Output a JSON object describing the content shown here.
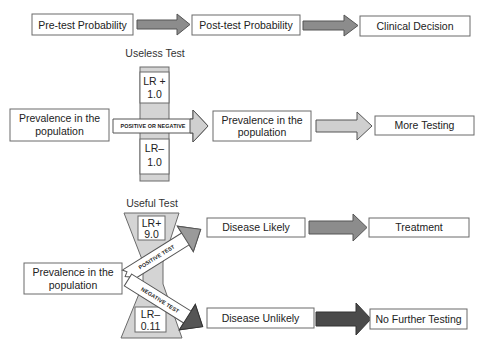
{
  "top_flow": {
    "step1": "Pre-test Probability",
    "step2": "Post-test Probability",
    "step3": "Clinical Decision"
  },
  "useless_test": {
    "title": "Useless Test",
    "lr_pos_label": "LR +",
    "lr_pos_value": "1.0",
    "lr_neg_label": "LR–",
    "lr_neg_value": "1.0",
    "arrow_label": "POSITIVE OR NEGATIVE",
    "input_line1": "Prevalence in the",
    "input_line2": "population",
    "output_line1": "Prevalence in the",
    "output_line2": "population",
    "outcome": "More Testing"
  },
  "useful_test": {
    "title": "Useful Test",
    "lr_pos_label": "LR+",
    "lr_pos_value": "9.0",
    "lr_neg_label": "LR–",
    "lr_neg_value": "0.11",
    "positive_arrow_label": "POSITIVE TEST",
    "negative_arrow_label": "NEGATIVE TEST",
    "input_line1": "Prevalence in the",
    "input_line2": "population",
    "positive_result": "Disease Likely",
    "positive_outcome": "Treatment",
    "negative_result": "Disease Unlikely",
    "negative_outcome": "No Further Testing"
  },
  "colors": {
    "box_stroke": "#6a6a6a",
    "arrow_mid": "#8c8c8c",
    "arrow_light": "#cfcfcf",
    "arrow_dark": "#4a4a4a",
    "band": "#d4d4d4"
  }
}
